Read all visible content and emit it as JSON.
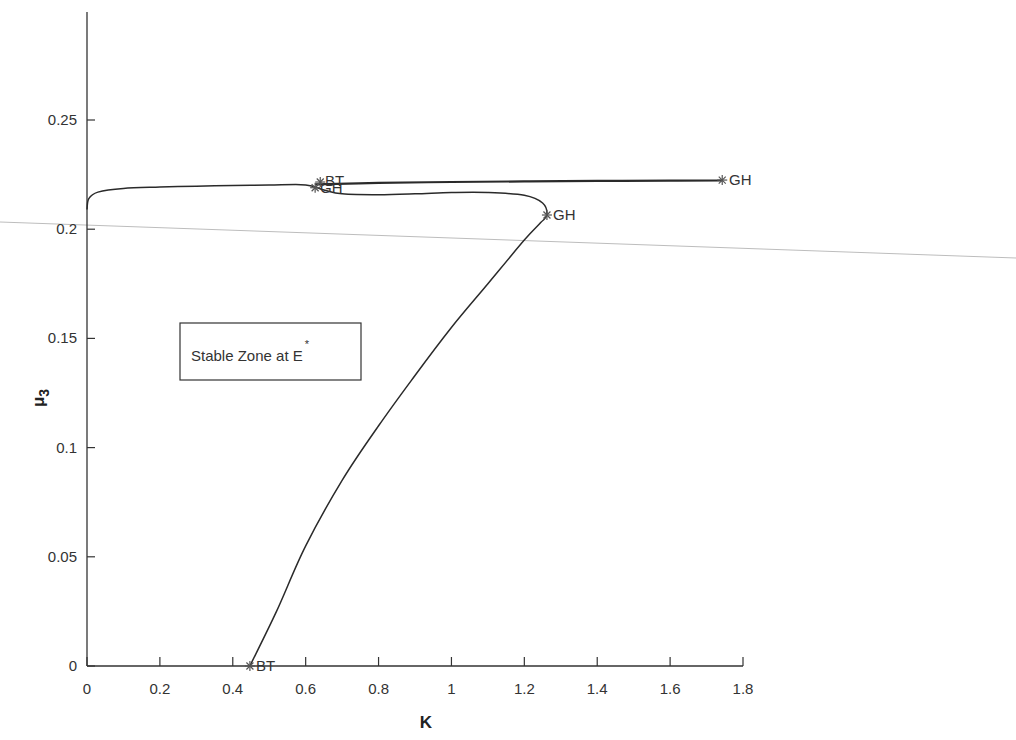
{
  "chart_data": {
    "type": "line",
    "title": "",
    "xlabel": "K",
    "ylabel": "μ3",
    "ylabel_main": "μ",
    "ylabel_sub": "3",
    "xlim": [
      0,
      1.8
    ],
    "ylim": [
      0,
      0.3
    ],
    "x_ticks": [
      0,
      0.2,
      0.4,
      0.6,
      0.8,
      1,
      1.2,
      1.4,
      1.6,
      1.8
    ],
    "x_tick_labels": [
      "0",
      "0.2",
      "0.4",
      "0.6",
      "0.8",
      "1",
      "1.2",
      "1.4",
      "1.6",
      "1.8"
    ],
    "y_ticks": [
      0,
      0.05,
      0.1,
      0.15,
      0.2,
      0.25
    ],
    "y_tick_labels": [
      "0",
      "0.05",
      "0.1",
      "0.15",
      "0.2",
      "0.25"
    ],
    "grid": false,
    "series": [
      {
        "name": "Hopf bifurcation curve",
        "x": [
          0.447,
          0.52,
          0.6,
          0.7,
          0.8,
          0.9,
          1.0,
          1.1,
          1.2,
          1.245,
          1.262,
          1.25,
          1.2,
          1.1,
          1.0,
          0.9,
          0.8,
          0.7,
          0.65,
          0.6,
          0.5,
          0.4,
          0.3,
          0.2,
          0.1,
          0.03,
          0.005,
          0.0
        ],
        "y": [
          0.0,
          0.025,
          0.055,
          0.085,
          0.11,
          0.133,
          0.155,
          0.175,
          0.195,
          0.203,
          0.2065,
          0.212,
          0.2155,
          0.2168,
          0.2168,
          0.2162,
          0.2158,
          0.2162,
          0.218,
          0.2203,
          0.2202,
          0.22,
          0.2197,
          0.2193,
          0.2187,
          0.217,
          0.214,
          0.209
        ]
      },
      {
        "name": "Homoclinic / upper branch",
        "x": [
          0.626,
          0.8,
          1.0,
          1.2,
          1.4,
          1.6,
          1.743
        ],
        "y": [
          0.2205,
          0.2212,
          0.2216,
          0.2219,
          0.2221,
          0.2222,
          0.2223
        ]
      }
    ],
    "special_points": [
      {
        "label": "BT",
        "K": 0.447,
        "mu3": 0.0
      },
      {
        "label": "GH",
        "K": 1.262,
        "mu3": 0.2065
      },
      {
        "label": "GH",
        "K": 1.743,
        "mu3": 0.2225
      },
      {
        "label": "BT",
        "K": 0.64,
        "mu3": 0.2216
      },
      {
        "label": "GH",
        "K": 0.626,
        "mu3": 0.219
      }
    ],
    "annotations": [
      {
        "text": "Stable Zone at E",
        "superscript": "*",
        "boxed": true,
        "K": 0.25,
        "mu3": 0.145
      }
    ]
  },
  "labels": {
    "x_axis": "K",
    "y_axis_main": "μ",
    "y_axis_sub": "3",
    "annotation_text": "Stable Zone at E",
    "annotation_sup": "*",
    "pt_bt_low": "BT",
    "pt_gh_mid": "GH",
    "pt_gh_right": "GH",
    "pt_bt_up": "BT",
    "pt_gh_up": "GH"
  },
  "colors": {
    "curve": "#2a2a2a",
    "axis": "#333333",
    "marker": "#555555",
    "scan_line": "#b8b8b8"
  }
}
